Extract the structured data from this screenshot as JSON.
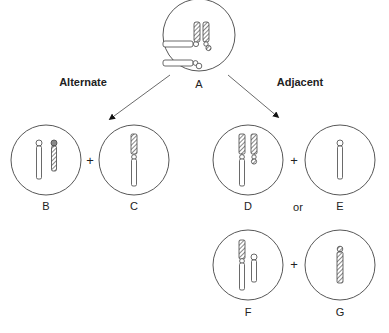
{
  "diagram": {
    "branches": {
      "left": "Alternate",
      "right": "Adjacent"
    },
    "cells": {
      "A": "A",
      "B": "B",
      "C": "C",
      "D": "D",
      "E": "E",
      "F": "F",
      "G": "G"
    },
    "operators": {
      "plus_bc": "+",
      "plus_de": "+",
      "plus_fg": "+",
      "or": "or"
    },
    "colors": {
      "stroke": "#444444",
      "hatch": "#666666"
    }
  }
}
